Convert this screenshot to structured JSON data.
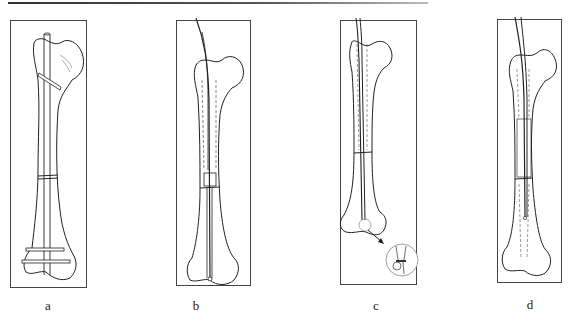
{
  "figure": {
    "panels": [
      {
        "id": "a",
        "label": "a",
        "description": "Femur with intramedullary rod fixed by proximal oblique screw and two distal transverse screws; transverse fracture at mid-shaft"
      },
      {
        "id": "b",
        "label": "b",
        "description": "Guide wire inserted from proximal femur through medullary canal across fracture to distal femur; reamed canal shown dashed; fragment alignment box at fracture"
      },
      {
        "id": "c",
        "label": "c",
        "description": "Guide wire with reamer in canal across fracture; circular inset magnifying distal tip with arrow"
      },
      {
        "id": "d",
        "label": "d",
        "description": "Nail advanced over guide wire across fracture into distal fragment; canal outlined dashed"
      }
    ]
  }
}
